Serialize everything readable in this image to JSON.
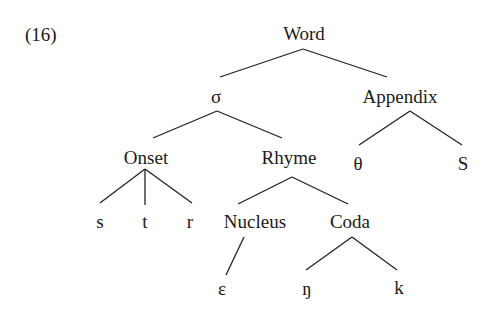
{
  "example_number": "(16)",
  "tree": {
    "root": "Word",
    "nodes": {
      "word": "Word",
      "syllable": "σ",
      "appendix": "Appendix",
      "onset": "Onset",
      "rhyme": "Rhyme",
      "appendix_theta": "θ",
      "appendix_s": "S",
      "onset_s": "s",
      "onset_t": "t",
      "onset_r": "r",
      "nucleus": "Nucleus",
      "coda": "Coda",
      "nucleus_epsilon": "ε",
      "coda_eng": "ŋ",
      "coda_k": "k"
    },
    "edges": [
      [
        "Word",
        "σ"
      ],
      [
        "Word",
        "Appendix"
      ],
      [
        "σ",
        "Onset"
      ],
      [
        "σ",
        "Rhyme"
      ],
      [
        "Appendix",
        "θ"
      ],
      [
        "Appendix",
        "S"
      ],
      [
        "Onset",
        "s"
      ],
      [
        "Onset",
        "t"
      ],
      [
        "Onset",
        "r"
      ],
      [
        "Rhyme",
        "Nucleus"
      ],
      [
        "Rhyme",
        "Coda"
      ],
      [
        "Nucleus",
        "ε"
      ],
      [
        "Coda",
        "ŋ"
      ],
      [
        "Coda",
        "k"
      ]
    ]
  }
}
